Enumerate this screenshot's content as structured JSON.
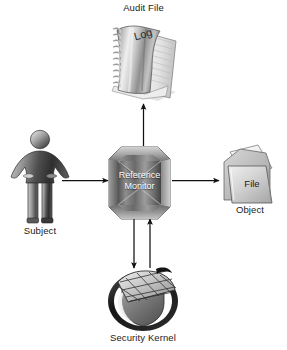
{
  "diagram": {
    "type": "security-architecture",
    "background_color": "#ffffff",
    "palette": {
      "ink": "#1a1a1a",
      "arrow": "#111111",
      "metal_light": "#f2f2f2",
      "metal_mid": "#9a9a9a",
      "metal_dark": "#4a4a4a",
      "shield_dark": "#1d1d1d",
      "shield_mid": "#7b7b7b"
    },
    "nodes": [
      {
        "id": "audit-file",
        "label": "Audit File",
        "inner_label": "Log",
        "icon": "spiral-notebook-icon",
        "label_position": "above"
      },
      {
        "id": "subject",
        "label": "Subject",
        "inner_label": "",
        "icon": "person-figure-icon",
        "label_position": "below"
      },
      {
        "id": "reference-monitor",
        "label": "",
        "inner_label": "Reference Monitor",
        "inner_label_line1": "Reference",
        "inner_label_line2": "Monitor",
        "icon": "beveled-octagon-icon",
        "label_position": "inside"
      },
      {
        "id": "object",
        "label": "Object",
        "inner_label": "File",
        "icon": "file-folder-icon",
        "label_position": "below"
      },
      {
        "id": "security-kernel",
        "label": "Security Kernel",
        "inner_label": "",
        "icon": "shield-grid-icon",
        "label_position": "below"
      }
    ],
    "arrows": [
      {
        "id": "subject-to-monitor",
        "from": "subject",
        "to": "reference-monitor",
        "direction": "right"
      },
      {
        "id": "monitor-to-object",
        "from": "reference-monitor",
        "to": "object",
        "direction": "right"
      },
      {
        "id": "monitor-to-audit",
        "from": "reference-monitor",
        "to": "audit-file",
        "direction": "up"
      },
      {
        "id": "monitor-to-kernel",
        "from": "reference-monitor",
        "to": "security-kernel",
        "direction": "down"
      },
      {
        "id": "kernel-to-monitor",
        "from": "security-kernel",
        "to": "reference-monitor",
        "direction": "up"
      }
    ]
  }
}
